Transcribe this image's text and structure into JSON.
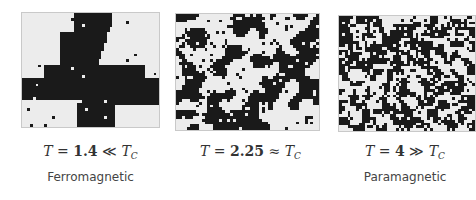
{
  "figure": {
    "panels": [
      {
        "id": "low-temperature",
        "temperature_symbol": "T",
        "equals": "=",
        "temperature_value": "1.4",
        "relation": "≪",
        "critical_symbol": "T",
        "critical_subscript": "C",
        "phase_label": "Ferromagnetic",
        "state": "ordered",
        "spin_colors": {
          "up": "#1a1a1a",
          "down": "#ececec"
        }
      },
      {
        "id": "critical-temperature",
        "temperature_symbol": "T",
        "equals": "=",
        "temperature_value": "2.25",
        "relation": "≈",
        "critical_symbol": "T",
        "critical_subscript": "C",
        "phase_label": "",
        "state": "critical",
        "spin_colors": {
          "up": "#1a1a1a",
          "down": "#ececec"
        }
      },
      {
        "id": "high-temperature",
        "temperature_symbol": "T",
        "equals": "=",
        "temperature_value": "4",
        "relation": "≫",
        "critical_symbol": "T",
        "critical_subscript": "C",
        "phase_label": "Paramagnetic",
        "state": "disordered",
        "spin_colors": {
          "up": "#1a1a1a",
          "down": "#ececec"
        }
      }
    ]
  }
}
